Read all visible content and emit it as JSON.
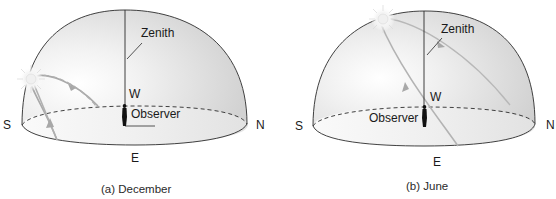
{
  "panels": [
    {
      "id": "december",
      "caption": "(a) December",
      "labels": {
        "south": "S",
        "north": "N",
        "east": "E",
        "west": "W",
        "zenith": "Zenith",
        "observer": "Observer"
      }
    },
    {
      "id": "june",
      "caption": "(b) June",
      "labels": {
        "south": "S",
        "north": "N",
        "east": "E",
        "west": "W",
        "zenith": "Zenith",
        "observer": "Observer"
      }
    }
  ],
  "colors": {
    "outline": "#2b2b2b",
    "dome_fill": "#dcdcdc",
    "sun_path": "#a8a8a8",
    "sun": "#f2f2f2"
  }
}
